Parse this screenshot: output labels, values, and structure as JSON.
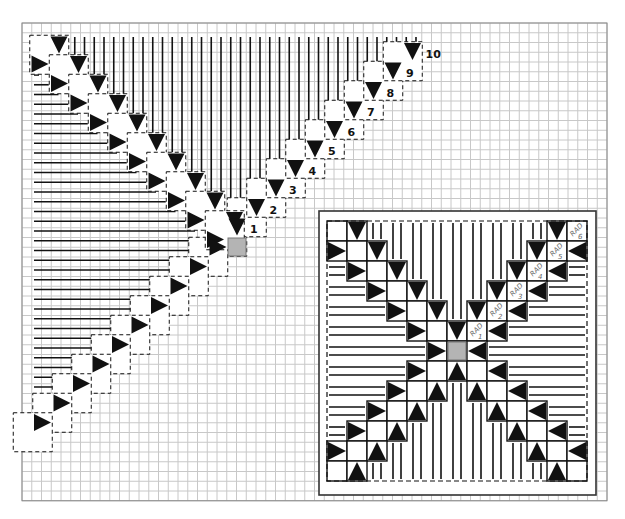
{
  "colors": {
    "grid": "#c8c8c8",
    "frame": "#555555",
    "ink": "#111111",
    "center": "#b4b4b4",
    "background": "#ffffff"
  },
  "main": {
    "grid": {
      "x": 22,
      "y": 23,
      "cols": 60,
      "rows": 49,
      "cell": 9.75
    },
    "block": 19.5,
    "center_square": {
      "cx": 237,
      "cy": 247
    },
    "level_labels": [
      "1",
      "2",
      "3",
      "4",
      "5",
      "6",
      "7",
      "8",
      "9",
      "10"
    ],
    "chains": {
      "down_right_diagonal": {
        "direction": "down",
        "count": 10,
        "start": [
          59,
          45
        ],
        "step": [
          19.5,
          19.5
        ]
      },
      "right_upper_diagonal": {
        "direction": "right",
        "count": 10,
        "start": [
          40,
          64
        ],
        "step": [
          19.5,
          19.5
        ]
      },
      "down_labeled_diagonal": {
        "direction": "down",
        "count": 10,
        "start": [
          237,
          227
        ],
        "step": [
          19.5,
          -19.5
        ]
      },
      "right_lower_diagonal": {
        "direction": "right",
        "count": 10,
        "start": [
          218,
          247
        ],
        "step": [
          -19.5,
          19.5
        ]
      }
    }
  },
  "inset": {
    "frame": {
      "x": 319,
      "y": 211,
      "w": 277,
      "h": 284
    },
    "origin": {
      "x": 327,
      "y": 221
    },
    "cell": 20,
    "size": 13,
    "center_cell": [
      6,
      6
    ],
    "rad_labels": [
      {
        "text": "RAD",
        "num": "1"
      },
      {
        "text": "RAD",
        "num": "2"
      },
      {
        "text": "RAD",
        "num": "3"
      },
      {
        "text": "RAD",
        "num": "4"
      },
      {
        "text": "RAD",
        "num": "5"
      },
      {
        "text": "RAD",
        "num": "6"
      }
    ],
    "triangles": {
      "down": [
        [
          0,
          1
        ],
        [
          1,
          2
        ],
        [
          2,
          3
        ],
        [
          3,
          4
        ],
        [
          4,
          5
        ],
        [
          5,
          6
        ],
        [
          0,
          11
        ],
        [
          1,
          10
        ],
        [
          2,
          9
        ],
        [
          3,
          8
        ],
        [
          4,
          7
        ]
      ],
      "right": [
        [
          1,
          0
        ],
        [
          2,
          1
        ],
        [
          3,
          2
        ],
        [
          4,
          3
        ],
        [
          5,
          4
        ],
        [
          6,
          5
        ],
        [
          7,
          4
        ],
        [
          8,
          3
        ],
        [
          9,
          2
        ],
        [
          10,
          1
        ],
        [
          11,
          0
        ]
      ],
      "left": [
        [
          1,
          12
        ],
        [
          2,
          11
        ],
        [
          3,
          10
        ],
        [
          4,
          9
        ],
        [
          5,
          8
        ],
        [
          6,
          7
        ],
        [
          7,
          8
        ],
        [
          8,
          9
        ],
        [
          9,
          10
        ],
        [
          10,
          11
        ],
        [
          11,
          12
        ]
      ],
      "up": [
        [
          7,
          6
        ],
        [
          8,
          5
        ],
        [
          9,
          4
        ],
        [
          10,
          3
        ],
        [
          11,
          2
        ],
        [
          12,
          1
        ],
        [
          8,
          7
        ],
        [
          9,
          8
        ],
        [
          10,
          9
        ],
        [
          11,
          10
        ],
        [
          12,
          11
        ]
      ]
    }
  }
}
